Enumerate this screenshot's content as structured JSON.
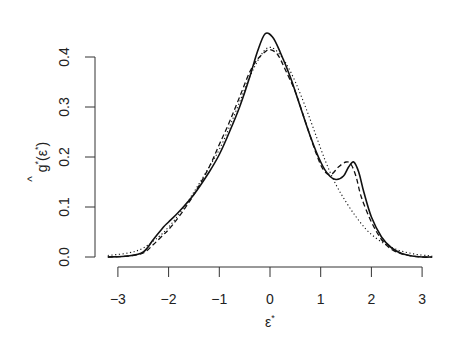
{
  "chart_data": {
    "type": "line",
    "title": "",
    "xlabel": "ε*",
    "ylabel": "ĝ*(ε*)",
    "xlim": [
      -3.2,
      3.2
    ],
    "ylim": [
      0,
      0.45
    ],
    "x_ticks": [
      "-3",
      "-2",
      "-1",
      "0",
      "1",
      "2",
      "3"
    ],
    "y_ticks": [
      "0.0",
      "0.1",
      "0.2",
      "0.3",
      "0.4"
    ],
    "grid": false,
    "legend": "none",
    "series": [
      {
        "name": "solid",
        "style": "solid",
        "x": [
          -3.2,
          -2.8,
          -2.5,
          -2.3,
          -2.1,
          -2.0,
          -1.8,
          -1.5,
          -1.2,
          -1.0,
          -0.8,
          -0.6,
          -0.4,
          -0.25,
          -0.1,
          0.05,
          0.2,
          0.4,
          0.6,
          0.8,
          1.0,
          1.15,
          1.3,
          1.45,
          1.55,
          1.65,
          1.75,
          1.85,
          2.0,
          2.2,
          2.4,
          2.6,
          2.8,
          3.0,
          3.2
        ],
        "values": [
          0.0,
          0.002,
          0.01,
          0.035,
          0.06,
          0.07,
          0.09,
          0.125,
          0.17,
          0.205,
          0.25,
          0.3,
          0.36,
          0.41,
          0.446,
          0.44,
          0.41,
          0.36,
          0.3,
          0.24,
          0.19,
          0.165,
          0.155,
          0.162,
          0.18,
          0.19,
          0.17,
          0.13,
          0.08,
          0.04,
          0.018,
          0.007,
          0.002,
          0.0,
          0.0
        ]
      },
      {
        "name": "dashed",
        "style": "dashed",
        "x": [
          -3.2,
          -2.8,
          -2.5,
          -2.3,
          -2.1,
          -2.0,
          -1.8,
          -1.5,
          -1.2,
          -1.0,
          -0.8,
          -0.6,
          -0.4,
          -0.25,
          -0.1,
          0.0,
          0.15,
          0.3,
          0.5,
          0.7,
          0.9,
          1.05,
          1.2,
          1.35,
          1.5,
          1.6,
          1.7,
          1.8,
          2.0,
          2.2,
          2.4,
          2.6,
          2.8,
          3.0,
          3.2
        ],
        "values": [
          0.0,
          0.002,
          0.008,
          0.025,
          0.045,
          0.055,
          0.08,
          0.125,
          0.18,
          0.225,
          0.27,
          0.32,
          0.37,
          0.395,
          0.41,
          0.415,
          0.405,
          0.375,
          0.33,
          0.27,
          0.21,
          0.175,
          0.165,
          0.18,
          0.19,
          0.185,
          0.16,
          0.12,
          0.07,
          0.035,
          0.015,
          0.006,
          0.002,
          0.0,
          0.0
        ]
      },
      {
        "name": "dotted",
        "style": "dotted",
        "x": [
          -3.2,
          -2.8,
          -2.5,
          -2.2,
          -2.0,
          -1.8,
          -1.5,
          -1.2,
          -1.0,
          -0.8,
          -0.6,
          -0.4,
          -0.2,
          -0.05,
          0.1,
          0.3,
          0.5,
          0.7,
          0.9,
          1.1,
          1.3,
          1.5,
          1.7,
          1.9,
          2.1,
          2.3,
          2.5,
          2.7,
          2.9,
          3.1,
          3.2
        ],
        "values": [
          0.003,
          0.008,
          0.018,
          0.04,
          0.06,
          0.085,
          0.13,
          0.18,
          0.215,
          0.26,
          0.31,
          0.36,
          0.4,
          0.418,
          0.415,
          0.39,
          0.35,
          0.3,
          0.245,
          0.19,
          0.145,
          0.11,
          0.08,
          0.055,
          0.037,
          0.024,
          0.015,
          0.009,
          0.005,
          0.003,
          0.002
        ]
      }
    ]
  }
}
